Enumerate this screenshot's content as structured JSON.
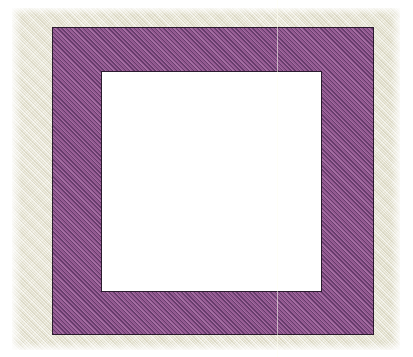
{
  "figure": {
    "title": "Hatched square annulus",
    "description": "A purple diagonally-hatched square frame with a white square hole in the centre, drawn on a cream textured fabric background.",
    "canvas": {
      "width_px": 413,
      "height_px": 357,
      "page_color": "#ffffff"
    },
    "background_patch": {
      "name": "cream textured fabric",
      "color": "#e9e7d6",
      "x_px": 12,
      "y_px": 8,
      "width_px": 388,
      "height_px": 342,
      "texture": "diagonal woven weave"
    },
    "outer_square": {
      "label": "outer square",
      "fill_color": "#9b5f98",
      "hatch_color": "#623868",
      "outline_color": "#2b1b2e",
      "hatch_angle_deg": 45,
      "hatch_spacing_px": 3,
      "x_px": 52,
      "y_px": 27,
      "width_px": 322,
      "height_px": 308,
      "outline_width_px": 1.5
    },
    "inner_square": {
      "label": "inner square",
      "fill_color": "#ffffff",
      "outline_color": "#2b1b2e",
      "x_px": 101,
      "y_px": 71,
      "width_px": 221,
      "height_px": 221,
      "outline_width_px": 1.5
    },
    "seam_artifact": {
      "label": "faint vertical seam",
      "color": "#fffff0",
      "x_px": 277,
      "width_px": 1
    }
  }
}
